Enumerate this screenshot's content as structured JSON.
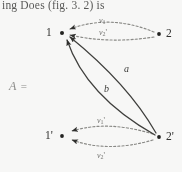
{
  "page": {
    "width": 182,
    "height": 172,
    "background": "#fdfdfc",
    "running_text": "ing Does (fig. 3. 2) is"
  },
  "formula": {
    "symbol": "A",
    "equals": "="
  },
  "figure": {
    "type": "directed-multigraph",
    "colors": {
      "solid_edge": "#3a3a38",
      "dashed_edge": "#8a8a86",
      "node": "#1e1e1c",
      "text": "#2e2e2c"
    },
    "nodes": [
      {
        "id": "n1",
        "label": "1",
        "prime": "",
        "x": 62,
        "y": 33,
        "label_x": 46,
        "label_y": 27
      },
      {
        "id": "n2",
        "label": "2",
        "prime": "",
        "x": 159,
        "y": 34,
        "label_x": 166,
        "label_y": 28
      },
      {
        "id": "n1p",
        "label": "1",
        "prime": "'",
        "x": 62,
        "y": 136,
        "label_x": 45,
        "label_y": 130
      },
      {
        "id": "n2p",
        "label": "2",
        "prime": "'",
        "x": 159,
        "y": 137,
        "label_x": 166,
        "label_y": 131
      }
    ],
    "dashed_edges": [
      {
        "id": "e-v1",
        "var": "v",
        "sub": "1",
        "prime": "",
        "from": "n2",
        "to": "n1",
        "label_x": 99,
        "label_y": 17
      },
      {
        "id": "e-v2p",
        "var": "v",
        "sub": "2",
        "prime": "'",
        "from": "n2",
        "to": "n1",
        "label_x": 99,
        "label_y": 29
      },
      {
        "id": "e-v1p",
        "var": "v",
        "sub": "1",
        "prime": "'",
        "from": "n2p",
        "to": "n1p",
        "label_x": 97,
        "label_y": 117
      },
      {
        "id": "e-v2p2",
        "var": "v",
        "sub": "2",
        "prime": "'",
        "from": "n2p",
        "to": "n1p",
        "label_x": 97,
        "label_y": 152
      }
    ],
    "solid_edges": [
      {
        "id": "arc-a",
        "label": "a",
        "from": "n2p",
        "to": "n1",
        "label_x": 124,
        "label_y": 64
      },
      {
        "id": "arc-b",
        "label": "b",
        "from": "n2p",
        "to": "n1",
        "label_x": 104,
        "label_y": 84
      }
    ]
  }
}
